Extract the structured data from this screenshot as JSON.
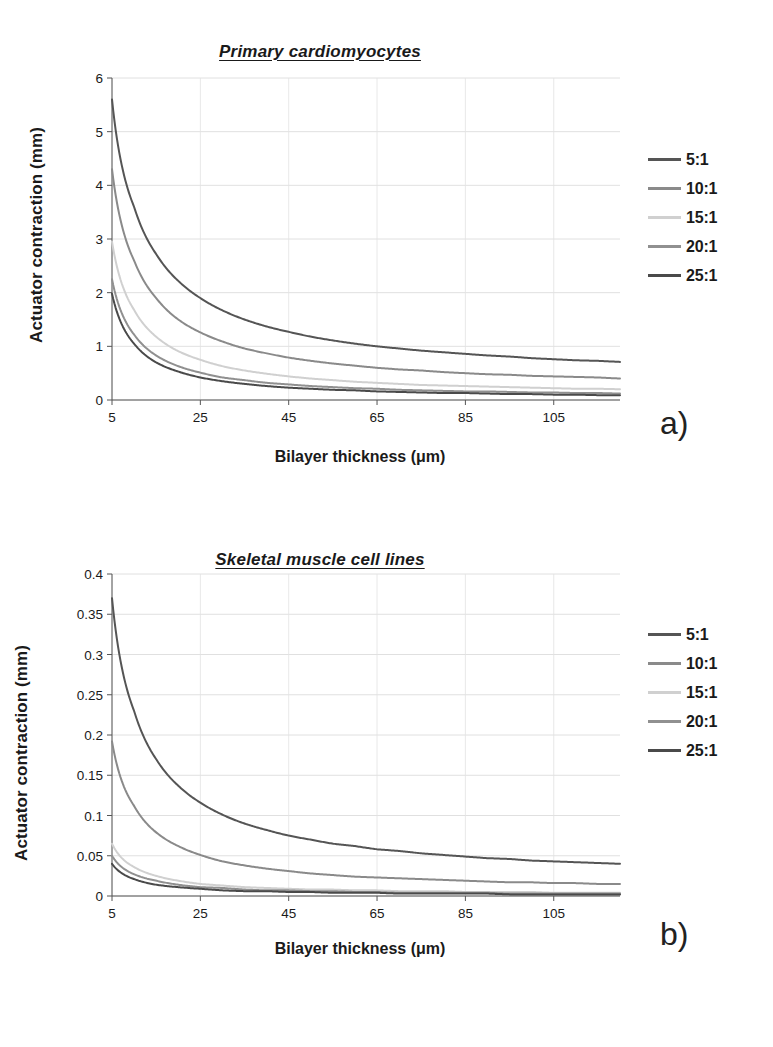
{
  "figure": {
    "background": "#ffffff",
    "panels": [
      {
        "letter": "a)",
        "title": "Primary cardiomyocytes",
        "xlabel": "Bilayer thickness (μm)",
        "ylabel": "Actuator contraction (mm)"
      },
      {
        "letter": "b)",
        "title": "Skeletal muscle cell lines",
        "xlabel": "Bilayer thickness (μm)",
        "ylabel": "Actuator contraction (mm)"
      }
    ]
  },
  "legend": {
    "position": "right",
    "entries": [
      {
        "label": "5:1",
        "color": "#555555"
      },
      {
        "label": "10:1",
        "color": "#8a8a8a"
      },
      {
        "label": "15:1",
        "color": "#d0d0d0"
      },
      {
        "label": "20:1",
        "color": "#909090"
      },
      {
        "label": "25:1",
        "color": "#4a4a4a"
      }
    ]
  },
  "chart_data": [
    {
      "type": "line",
      "title": "Primary cardiomyocytes",
      "xlabel": "Bilayer thickness (μm)",
      "ylabel": "Actuator contraction (mm)",
      "xlim": [
        5,
        120
      ],
      "ylim": [
        0,
        6
      ],
      "xticks": [
        5,
        25,
        45,
        65,
        85,
        105
      ],
      "yticks": [
        0,
        1,
        2,
        3,
        4,
        5,
        6
      ],
      "grid": true,
      "x": [
        5,
        10,
        15,
        20,
        25,
        30,
        35,
        40,
        45,
        50,
        55,
        60,
        65,
        70,
        75,
        80,
        85,
        90,
        95,
        100,
        105,
        110,
        115,
        120
      ],
      "series": [
        {
          "name": "5:1",
          "color": "#555555",
          "values": [
            5.6,
            3.6,
            2.72,
            2.22,
            1.9,
            1.67,
            1.5,
            1.37,
            1.27,
            1.18,
            1.11,
            1.05,
            1.0,
            0.96,
            0.92,
            0.89,
            0.86,
            0.83,
            0.81,
            0.78,
            0.76,
            0.74,
            0.73,
            0.71
          ]
        },
        {
          "name": "10:1",
          "color": "#8a8a8a",
          "values": [
            4.3,
            2.6,
            1.9,
            1.5,
            1.26,
            1.09,
            0.96,
            0.87,
            0.79,
            0.73,
            0.68,
            0.64,
            0.6,
            0.57,
            0.55,
            0.52,
            0.5,
            0.48,
            0.47,
            0.45,
            0.44,
            0.43,
            0.42,
            0.4
          ]
        },
        {
          "name": "15:1",
          "color": "#d0d0d0",
          "values": [
            2.95,
            1.68,
            1.18,
            0.91,
            0.75,
            0.63,
            0.55,
            0.49,
            0.44,
            0.4,
            0.37,
            0.34,
            0.32,
            0.3,
            0.28,
            0.27,
            0.26,
            0.25,
            0.24,
            0.23,
            0.22,
            0.21,
            0.21,
            0.2
          ]
        },
        {
          "name": "20:1",
          "color": "#909090",
          "values": [
            2.25,
            1.22,
            0.83,
            0.63,
            0.51,
            0.42,
            0.37,
            0.32,
            0.29,
            0.26,
            0.24,
            0.22,
            0.21,
            0.19,
            0.18,
            0.17,
            0.16,
            0.16,
            0.15,
            0.14,
            0.14,
            0.13,
            0.13,
            0.12
          ]
        },
        {
          "name": "25:1",
          "color": "#4a4a4a",
          "values": [
            1.98,
            1.05,
            0.7,
            0.53,
            0.42,
            0.35,
            0.3,
            0.26,
            0.23,
            0.21,
            0.19,
            0.18,
            0.16,
            0.15,
            0.14,
            0.13,
            0.13,
            0.12,
            0.11,
            0.11,
            0.1,
            0.1,
            0.09,
            0.09
          ]
        }
      ]
    },
    {
      "type": "line",
      "title": "Skeletal muscle cell lines",
      "xlabel": "Bilayer thickness (μm)",
      "ylabel": "Actuator contraction (mm)",
      "xlim": [
        5,
        120
      ],
      "ylim": [
        0,
        0.4
      ],
      "xticks": [
        5,
        25,
        45,
        65,
        85,
        105
      ],
      "yticks": [
        0,
        0.05,
        0.1,
        0.15,
        0.2,
        0.25,
        0.3,
        0.35,
        0.4
      ],
      "ytick_labels": [
        "0",
        "0.05",
        "0.1",
        "0.15",
        "0.2",
        "0.25",
        "0.3",
        "0.35",
        "0.4"
      ],
      "grid": true,
      "x": [
        5,
        10,
        15,
        20,
        25,
        30,
        35,
        40,
        45,
        50,
        55,
        60,
        65,
        70,
        75,
        80,
        85,
        90,
        95,
        100,
        105,
        110,
        115,
        120
      ],
      "series": [
        {
          "name": "5:1",
          "color": "#555555",
          "values": [
            0.37,
            0.23,
            0.17,
            0.137,
            0.116,
            0.101,
            0.09,
            0.082,
            0.075,
            0.07,
            0.065,
            0.062,
            0.058,
            0.056,
            0.053,
            0.051,
            0.049,
            0.047,
            0.046,
            0.044,
            0.043,
            0.042,
            0.041,
            0.04
          ]
        },
        {
          "name": "10:1",
          "color": "#8a8a8a",
          "values": [
            0.192,
            0.112,
            0.079,
            0.062,
            0.051,
            0.043,
            0.038,
            0.034,
            0.031,
            0.028,
            0.026,
            0.024,
            0.023,
            0.022,
            0.021,
            0.02,
            0.019,
            0.018,
            0.017,
            0.017,
            0.016,
            0.016,
            0.015,
            0.015
          ]
        },
        {
          "name": "15:1",
          "color": "#d0d0d0",
          "values": [
            0.065,
            0.036,
            0.025,
            0.019,
            0.015,
            0.013,
            0.011,
            0.01,
            0.009,
            0.008,
            0.008,
            0.007,
            0.007,
            0.006,
            0.006,
            0.006,
            0.005,
            0.005,
            0.005,
            0.005,
            0.004,
            0.004,
            0.004,
            0.004
          ]
        },
        {
          "name": "20:1",
          "color": "#909090",
          "values": [
            0.05,
            0.027,
            0.019,
            0.014,
            0.011,
            0.01,
            0.008,
            0.007,
            0.007,
            0.006,
            0.006,
            0.005,
            0.005,
            0.004,
            0.004,
            0.004,
            0.004,
            0.004,
            0.003,
            0.003,
            0.003,
            0.003,
            0.003,
            0.003
          ]
        },
        {
          "name": "25:1",
          "color": "#4a4a4a",
          "values": [
            0.04,
            0.021,
            0.014,
            0.011,
            0.009,
            0.007,
            0.006,
            0.006,
            0.005,
            0.005,
            0.004,
            0.004,
            0.004,
            0.003,
            0.003,
            0.003,
            0.003,
            0.003,
            0.002,
            0.002,
            0.002,
            0.002,
            0.002,
            0.002
          ]
        }
      ]
    }
  ]
}
